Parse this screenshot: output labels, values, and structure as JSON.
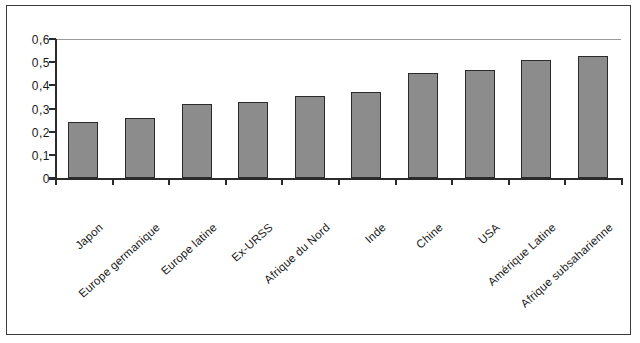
{
  "chart_data": {
    "type": "bar",
    "title": "",
    "subtitle": "",
    "xlabel": "",
    "ylabel": "",
    "ylim": [
      0,
      0.6
    ],
    "ytick_labels": [
      "0,6",
      "0,5",
      "0,4",
      "0,3",
      "0,2",
      "0,1",
      "0"
    ],
    "ytick_values": [
      0.6,
      0.5,
      0.4,
      0.3,
      0.2,
      0.1,
      0
    ],
    "grid": "top-gridline-only",
    "legend": "none",
    "decimal_separator": ",",
    "categories": [
      "Japon",
      "Europe germanique",
      "Europe latine",
      "Ex-URSS",
      "Afrique du Nord",
      "Inde",
      "Chine",
      "USA",
      "Amérique Latine",
      "Afrique subsaharienne"
    ],
    "values": [
      0.24,
      0.26,
      0.32,
      0.33,
      0.355,
      0.37,
      0.455,
      0.465,
      0.51,
      0.525
    ],
    "bar_color": "#8c8c8c",
    "bar_border_color": "#2b2b2b",
    "axis_color": "#2b2b2b",
    "gridline_color": "#9a9a9a",
    "frame_color": "#3a3a3a",
    "background": "#ffffff"
  }
}
